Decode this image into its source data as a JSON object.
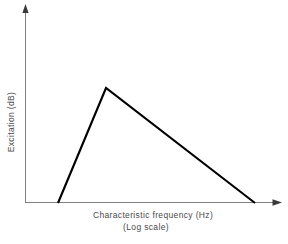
{
  "figure": {
    "background_color": "#ffffff",
    "width": 288,
    "height": 244
  },
  "labels": {
    "ylabel": "Excitation (dB)",
    "xlabel_line1": "Characteristic frequency (Hz)",
    "xlabel_line2": "(Log scale)"
  },
  "chart_data": {
    "type": "line",
    "title": "",
    "xlabel": "Characteristic frequency (Hz)",
    "xlabel_sub": "(Log scale)",
    "ylabel": "Excitation (dB)",
    "grid": false,
    "legend": null,
    "axis_style": {
      "arrow_heads": true,
      "tick_labels": false,
      "spines": [
        "left",
        "bottom"
      ],
      "line_color": "#808080"
    },
    "series": [
      {
        "name": "excitation pattern",
        "color": "#000000",
        "line_width": 2,
        "points": [
          {
            "x": 58,
            "y": 203
          },
          {
            "x": 106,
            "y": 88
          },
          {
            "x": 255,
            "y": 203
          }
        ],
        "description": "asymmetric triangular excitation pattern: steep low-frequency skirt, shallow high-frequency skirt"
      }
    ],
    "axes_pixels": {
      "x_origin": 25,
      "y_origin": 203,
      "x_end": 281,
      "y_top": 5
    },
    "xlim": [
      0,
      1
    ],
    "ylim": [
      0,
      1
    ]
  }
}
